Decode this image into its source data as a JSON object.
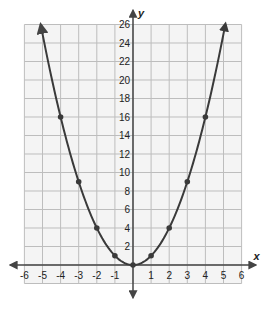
{
  "chart_data": {
    "type": "line",
    "title": "",
    "function": "y = x^2",
    "xlabel": "x",
    "ylabel": "y",
    "xlim": [
      -6,
      6
    ],
    "ylim": [
      -2,
      26
    ],
    "grid": true,
    "x_ticks": [
      -6,
      -5,
      -4,
      -3,
      -2,
      -1,
      1,
      2,
      3,
      4,
      5,
      6
    ],
    "y_ticks": [
      2,
      4,
      6,
      8,
      10,
      12,
      14,
      16,
      18,
      20,
      22,
      24,
      26
    ],
    "series": [
      {
        "name": "y = x^2",
        "points": [
          {
            "x": -4,
            "y": 16
          },
          {
            "x": -3,
            "y": 9
          },
          {
            "x": -2,
            "y": 4
          },
          {
            "x": -1,
            "y": 1
          },
          {
            "x": 0,
            "y": 0
          },
          {
            "x": 1,
            "y": 1
          },
          {
            "x": 2,
            "y": 4
          },
          {
            "x": 3,
            "y": 9
          },
          {
            "x": 4,
            "y": 16
          }
        ],
        "curve_extent_x": [
          -5.1,
          5.1
        ],
        "arrows_at_ends": true
      }
    ],
    "colors": {
      "grid": "#bdbdbd",
      "axis": "#444444",
      "curve": "#3a3a3a",
      "points": "#3a3a3a",
      "background": "#f4f4f4"
    }
  }
}
